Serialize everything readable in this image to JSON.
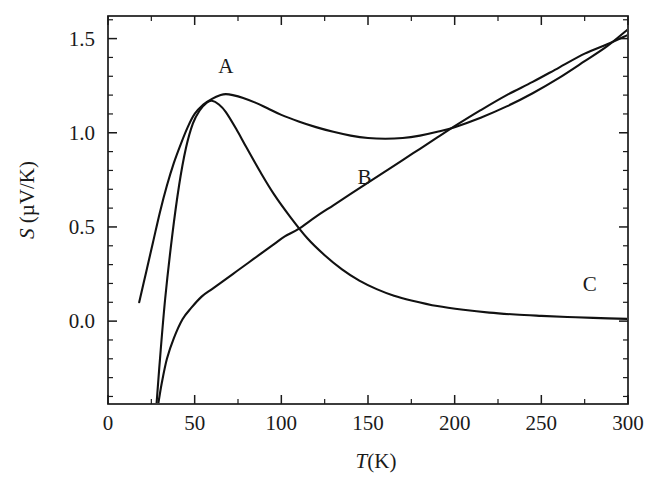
{
  "figure": {
    "background_color": "#ffffff",
    "line_color": "#111111",
    "axis_color": "#1a1a1a"
  },
  "axes": {
    "x_label_italic": "T",
    "x_label_unit": "(K)",
    "x_label_full": "T(K)",
    "y_label_italic": "S",
    "y_label_unit": "(µV/K)",
    "y_label_full": "S (µV/K)",
    "x_ticks": [
      "0",
      "50",
      "100",
      "150",
      "200",
      "250",
      "300"
    ],
    "y_ticks": [
      "0.0",
      "0.5",
      "1.0",
      "1.5"
    ],
    "x_minor_count_between": 1,
    "y_minor_count_between": 4,
    "grid": "off",
    "frame": "box"
  },
  "curve_labels": [
    {
      "text": "A",
      "x": 68,
      "y": 1.32
    },
    {
      "text": "B",
      "x": 148,
      "y": 0.73
    },
    {
      "text": "C",
      "x": 278,
      "y": 0.16
    }
  ],
  "chart_data": {
    "type": "line",
    "title": "",
    "xlabel": "T(K)",
    "ylabel": "S (µV/K)",
    "xlim": [
      0,
      300
    ],
    "ylim": [
      -0.44,
      1.62
    ],
    "x_ticks": [
      0,
      50,
      100,
      150,
      200,
      250,
      300
    ],
    "y_ticks": [
      0.0,
      0.5,
      1.0,
      1.5
    ],
    "grid": false,
    "legend": "inline-annotations",
    "annotations": [
      "A",
      "B",
      "C"
    ],
    "series": [
      {
        "name": "A",
        "label_position": {
          "x": 68,
          "y": 1.32
        },
        "x": [
          18,
          22,
          26,
          30,
          34,
          38,
          42,
          46,
          50,
          55,
          60,
          65,
          68,
          72,
          78,
          85,
          92,
          100,
          110,
          120,
          130,
          140,
          150,
          160,
          170,
          180,
          190,
          200,
          215,
          230,
          245,
          260,
          275,
          288,
          300
        ],
        "y": [
          0.1,
          0.26,
          0.42,
          0.58,
          0.72,
          0.84,
          0.94,
          1.03,
          1.1,
          1.15,
          1.18,
          1.2,
          1.205,
          1.2,
          1.185,
          1.16,
          1.13,
          1.095,
          1.06,
          1.03,
          1.005,
          0.985,
          0.972,
          0.968,
          0.972,
          0.985,
          1.005,
          1.03,
          1.08,
          1.14,
          1.21,
          1.29,
          1.38,
          1.46,
          1.55
        ]
      },
      {
        "name": "B",
        "label_position": {
          "x": 148,
          "y": 0.73
        },
        "x": [
          29,
          31,
          34,
          38,
          43,
          48,
          54,
          60,
          66,
          72,
          78,
          84,
          90,
          96,
          102,
          110,
          120,
          130,
          140,
          150,
          160,
          170,
          180,
          190,
          200,
          215,
          230,
          245,
          260,
          275,
          288,
          300
        ],
        "y": [
          -0.44,
          -0.33,
          -0.2,
          -0.09,
          0.01,
          0.07,
          0.13,
          0.17,
          0.21,
          0.25,
          0.29,
          0.33,
          0.37,
          0.41,
          0.45,
          0.49,
          0.555,
          0.615,
          0.675,
          0.735,
          0.795,
          0.855,
          0.915,
          0.975,
          1.035,
          1.12,
          1.2,
          1.27,
          1.345,
          1.42,
          1.47,
          1.52
        ]
      },
      {
        "name": "C",
        "label_position": {
          "x": 278,
          "y": 0.16
        },
        "x": [
          28,
          30,
          33,
          37,
          41,
          45,
          49,
          53,
          57,
          60,
          64,
          68,
          74,
          80,
          88,
          96,
          105,
          115,
          125,
          135,
          145,
          155,
          165,
          175,
          190,
          205,
          220,
          235,
          250,
          265,
          280,
          300
        ],
        "y": [
          -0.44,
          -0.2,
          0.12,
          0.45,
          0.72,
          0.92,
          1.05,
          1.12,
          1.16,
          1.17,
          1.15,
          1.11,
          1.02,
          0.92,
          0.79,
          0.67,
          0.555,
          0.44,
          0.35,
          0.275,
          0.215,
          0.17,
          0.135,
          0.11,
          0.08,
          0.06,
          0.045,
          0.035,
          0.028,
          0.022,
          0.017,
          0.012
        ]
      }
    ]
  }
}
